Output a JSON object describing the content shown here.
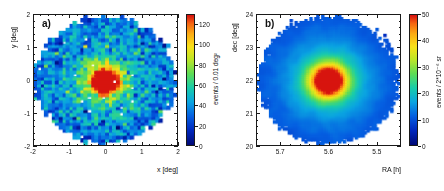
{
  "figure": {
    "background": "#ffffff",
    "frame_color": "#1a1a1a",
    "panel_count": 2
  },
  "chart_data": [
    {
      "type": "heatmap",
      "panel_label": "a)",
      "title": "",
      "xlabel": "x [deg]",
      "ylabel": "y [deg]",
      "xlim": [
        -2,
        2
      ],
      "ylim": [
        -2,
        2
      ],
      "xticks": [
        -2,
        -1,
        0,
        1,
        2
      ],
      "xticklabels": [
        "-2",
        "-1",
        "0",
        "1",
        "2"
      ],
      "yticks": [
        -2,
        -1,
        0,
        1,
        2
      ],
      "yticklabels": [
        "-2",
        "-1",
        "0",
        "1",
        "2"
      ],
      "x_minor_per_major": 5,
      "y_minor_per_major": 5,
      "grid": false,
      "colorbar": {
        "label": "events / 0.01 deg²",
        "vmin": 0,
        "vmax": 130,
        "ticks": [
          0,
          20,
          40,
          60,
          80,
          100,
          120
        ],
        "ticklabels": [
          "0",
          "20",
          "40",
          "60",
          "80",
          "100",
          "120"
        ],
        "colormap": "root-rainbow"
      },
      "field": {
        "description": "Noisy radially symmetric point-source excess on a flat background disc",
        "bins_x": 40,
        "bins_y": 40,
        "center": [
          0.0,
          0.0
        ],
        "peak_value": 130,
        "plateau_value": 28,
        "core_sigma_deg": 0.3,
        "halo_sigma_deg": 0.95,
        "halo_amplitude": 34,
        "acceptance_radius_deg": 1.95,
        "noise_sigma": 13,
        "dropout_probability": 0.012,
        "smoothing_passes": 0
      }
    },
    {
      "type": "heatmap",
      "panel_label": "b)",
      "title": "",
      "xlabel": "RA [h]",
      "ylabel": "dec [deg]",
      "xlim": [
        5.75,
        5.45
      ],
      "ylim": [
        20,
        24
      ],
      "xticks": [
        5.7,
        5.6,
        5.5
      ],
      "xticklabels": [
        "5.7",
        "5.6",
        "5.5"
      ],
      "yticks": [
        20,
        21,
        22,
        23,
        24
      ],
      "yticklabels": [
        "20",
        "21",
        "22",
        "23",
        "24"
      ],
      "x_minor_per_major": 5,
      "y_minor_per_major": 5,
      "grid": false,
      "colorbar": {
        "label": "events / 2*10⁻⁶ sr",
        "vmin": 0,
        "vmax": 50,
        "ticks": [
          0,
          10,
          20,
          30,
          40,
          50
        ],
        "ticklabels": [
          "0",
          "10",
          "20",
          "30",
          "40",
          "50"
        ],
        "colormap": "root-rainbow"
      },
      "field": {
        "description": "Smoothed radially symmetric excess on flat background disc, sharp red core",
        "bins_x": 60,
        "bins_y": 60,
        "center": [
          5.585,
          22.05
        ],
        "peak_value": 50,
        "plateau_value": 9,
        "core_sigma_deg": 0.33,
        "halo_sigma_deg": 0.85,
        "halo_amplitude": 16,
        "acceptance_radius_deg": 1.95,
        "noise_sigma": 1.6,
        "dropout_probability": 0.0,
        "smoothing_passes": 2
      }
    }
  ]
}
